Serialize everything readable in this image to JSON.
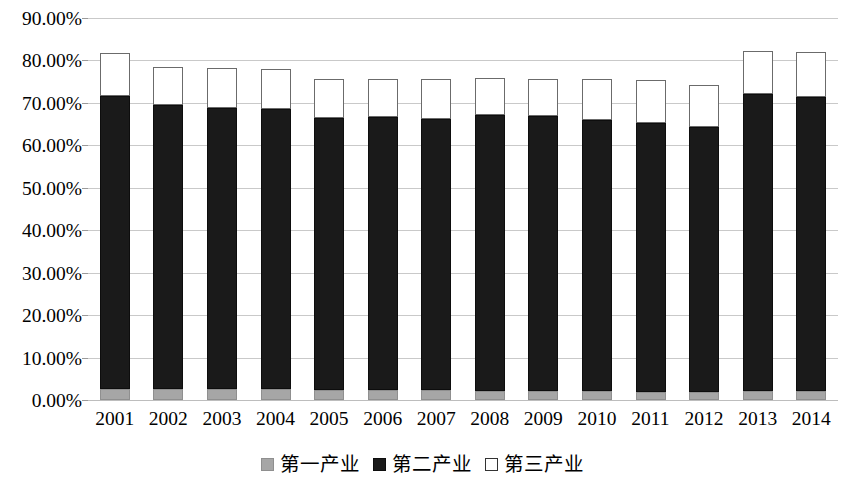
{
  "chart_data": {
    "type": "bar",
    "stacked": true,
    "title": "",
    "xlabel": "",
    "ylabel": "",
    "ylim": [
      0,
      90
    ],
    "ytick_labels": [
      "0.00%",
      "10.00%",
      "20.00%",
      "30.00%",
      "40.00%",
      "50.00%",
      "60.00%",
      "70.00%",
      "80.00%",
      "90.00%"
    ],
    "ytick_values": [
      0,
      10,
      20,
      30,
      40,
      50,
      60,
      70,
      80,
      90
    ],
    "grid": true,
    "legend_position": "bottom",
    "categories": [
      "2001",
      "2002",
      "2003",
      "2004",
      "2005",
      "2006",
      "2007",
      "2008",
      "2009",
      "2010",
      "2011",
      "2012",
      "2013",
      "2014"
    ],
    "series": [
      {
        "name": "第一产业",
        "color": "#a6a6a6",
        "values": [
          2.6,
          2.6,
          2.5,
          2.5,
          2.4,
          2.4,
          2.3,
          2.2,
          2.1,
          2.1,
          2.0,
          2.0,
          2.1,
          2.1
        ]
      },
      {
        "name": "第二产业",
        "color": "#1a1a1a",
        "values": [
          69.1,
          66.9,
          66.4,
          66.1,
          64.1,
          64.3,
          63.9,
          65.0,
          64.9,
          63.9,
          63.2,
          62.3,
          69.9,
          69.4
        ]
      },
      {
        "name": "第三产业",
        "color": "#ffffff",
        "values": [
          10.1,
          9.0,
          9.3,
          9.4,
          9.1,
          9.0,
          9.4,
          8.7,
          8.7,
          9.7,
          10.2,
          9.9,
          10.3,
          10.4
        ]
      }
    ],
    "series_totals": [
      81.8,
      78.5,
      78.2,
      78.0,
      75.6,
      75.7,
      75.6,
      75.9,
      75.7,
      75.7,
      75.4,
      74.2,
      82.3,
      81.9
    ]
  },
  "legend": {
    "items": [
      {
        "label": "第一产业",
        "swatch": "gray-filled-square-icon"
      },
      {
        "label": "第二产业",
        "swatch": "black-filled-square-icon"
      },
      {
        "label": "第三产业",
        "swatch": "white-outline-square-icon"
      }
    ]
  }
}
